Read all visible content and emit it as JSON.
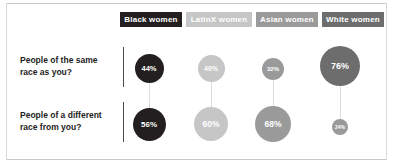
{
  "figure": {
    "groups": [
      {
        "label": "Black women",
        "color": "#231f20"
      },
      {
        "label": "LatinX women",
        "color": "#c6c6c6"
      },
      {
        "label": "Asian women",
        "color": "#9a9a9a"
      },
      {
        "label": "White women",
        "color": "#6d6d6d"
      }
    ],
    "rows": [
      {
        "label": "People of the same\nrace as you?"
      },
      {
        "label": "People of a different\nrace from you?"
      }
    ]
  },
  "chart_data": {
    "type": "bubble",
    "title": "",
    "xlabel": "",
    "ylabel": "",
    "categories": [
      "Black women",
      "LatinX women",
      "Asian women",
      "White women"
    ],
    "rows": [
      "People of the same race as you?",
      "People of a different race from you?"
    ],
    "units": "percent",
    "legend": "position: top, rendered as colored label chips",
    "grid": false,
    "series": [
      {
        "name": "People of the same race as you?",
        "values": [
          44,
          40,
          32,
          76
        ],
        "labels": [
          "44%",
          "40%",
          "32%",
          "76%"
        ]
      },
      {
        "name": "People of a different race from you?",
        "values": [
          56,
          60,
          68,
          24
        ],
        "labels": [
          "56%",
          "60%",
          "68%",
          "24%"
        ]
      }
    ],
    "colors": [
      "#231f20",
      "#c6c6c6",
      "#9a9a9a",
      "#6d6d6d"
    ],
    "note": "Bubble area scales with the percentage value; each column's two values sum to 100%."
  },
  "bubbles": [
    {
      "label": "44%",
      "color": "#231f20",
      "cx": 149,
      "cy": 68,
      "r": 14.5,
      "fs": 7.5
    },
    {
      "label": "40%",
      "color": "#c6c6c6",
      "cx": 211,
      "cy": 68,
      "r": 13.5,
      "fs": 7.0
    },
    {
      "label": "32%",
      "color": "#9a9a9a",
      "cx": 273,
      "cy": 69,
      "r": 11.0,
      "fs": 6.0
    },
    {
      "label": "76%",
      "color": "#6d6d6d",
      "cx": 340,
      "cy": 66,
      "r": 20.0,
      "fs": 9.0
    },
    {
      "label": "56%",
      "color": "#231f20",
      "cx": 149,
      "cy": 124,
      "r": 16.5,
      "fs": 8.0
    },
    {
      "label": "60%",
      "color": "#c6c6c6",
      "cx": 211,
      "cy": 124,
      "r": 17.0,
      "fs": 8.5
    },
    {
      "label": "68%",
      "color": "#9a9a9a",
      "cx": 273,
      "cy": 124,
      "r": 18.0,
      "fs": 8.5
    },
    {
      "label": "24%",
      "color": "#9a9a9a",
      "cx": 340,
      "cy": 127,
      "r": 8.0,
      "fs": 5.0
    }
  ],
  "connectors": [
    {
      "x": 149,
      "top": 82,
      "height": 26
    },
    {
      "x": 211,
      "top": 81,
      "height": 26
    },
    {
      "x": 273,
      "top": 80,
      "height": 26
    },
    {
      "x": 340,
      "top": 86,
      "height": 33
    }
  ],
  "chips": [
    {
      "label": "Black women",
      "color": "#231f20",
      "left": 0,
      "width": 62
    },
    {
      "label": "LatinX women",
      "color": "#c6c6c6",
      "left": 66,
      "width": 66
    },
    {
      "label": "Asian women",
      "color": "#9a9a9a",
      "left": 136,
      "width": 62
    },
    {
      "label": "White women",
      "color": "#6d6d6d",
      "left": 202,
      "width": 62
    }
  ]
}
